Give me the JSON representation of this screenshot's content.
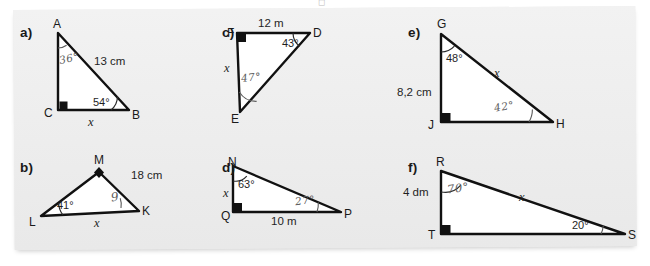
{
  "worksheet": {
    "top_partial_glyph": "◻",
    "problems": [
      {
        "id": "a",
        "label": "a)",
        "vertices": [
          {
            "name": "A"
          },
          {
            "name": "C"
          },
          {
            "name": "B"
          }
        ],
        "right_angle_at": "C",
        "angles": [
          {
            "at": "A",
            "value": "36°",
            "style": "handwritten"
          },
          {
            "at": "B",
            "value": "54°",
            "style": "printed"
          }
        ],
        "sides": [
          {
            "label": "13 cm",
            "kind": "measure"
          },
          {
            "label": "x",
            "kind": "unknown"
          }
        ]
      },
      {
        "id": "b",
        "label": "b)",
        "vertices": [
          {
            "name": "M"
          },
          {
            "name": "L"
          },
          {
            "name": "K"
          }
        ],
        "marker_at": "M",
        "angles": [
          {
            "at": "L",
            "value": "41°",
            "style": "printed"
          },
          {
            "at": "K",
            "value": "9",
            "style": "handwritten"
          }
        ],
        "sides": [
          {
            "label": "18 cm",
            "kind": "measure"
          },
          {
            "label": "x",
            "kind": "unknown"
          }
        ]
      },
      {
        "id": "c",
        "label": "c)",
        "vertices": [
          {
            "name": "F"
          },
          {
            "name": "D"
          },
          {
            "name": "E"
          }
        ],
        "right_angle_at": "F",
        "angles": [
          {
            "at": "D",
            "value": "43°",
            "style": "printed"
          },
          {
            "at": "E",
            "value": "47°",
            "style": "handwritten"
          }
        ],
        "sides": [
          {
            "label": "12 m",
            "kind": "measure"
          },
          {
            "label": "x",
            "kind": "unknown"
          }
        ]
      },
      {
        "id": "d",
        "label": "d)",
        "vertices": [
          {
            "name": "N"
          },
          {
            "name": "Q"
          },
          {
            "name": "P"
          }
        ],
        "right_angle_at": "Q",
        "angles": [
          {
            "at": "N",
            "value": "63°",
            "style": "printed"
          },
          {
            "at": "P",
            "value": "27°",
            "style": "handwritten"
          }
        ],
        "sides": [
          {
            "label": "10 m",
            "kind": "measure"
          },
          {
            "label": "x",
            "kind": "unknown"
          }
        ]
      },
      {
        "id": "e",
        "label": "e)",
        "vertices": [
          {
            "name": "G"
          },
          {
            "name": "J"
          },
          {
            "name": "H"
          }
        ],
        "right_angle_at": "J",
        "angles": [
          {
            "at": "G",
            "value": "48°",
            "style": "printed"
          },
          {
            "at": "H",
            "value": "42°",
            "style": "handwritten"
          }
        ],
        "sides": [
          {
            "label": "8,2 cm",
            "kind": "measure"
          },
          {
            "label": "x",
            "kind": "unknown"
          }
        ]
      },
      {
        "id": "f",
        "label": "f)",
        "vertices": [
          {
            "name": "R"
          },
          {
            "name": "T"
          },
          {
            "name": "S"
          }
        ],
        "right_angle_at": "T",
        "angles": [
          {
            "at": "R",
            "value": "70°",
            "style": "handwritten"
          },
          {
            "at": "S",
            "value": "20°",
            "style": "printed"
          }
        ],
        "sides": [
          {
            "label": "4 dm",
            "kind": "measure"
          },
          {
            "label": "x",
            "kind": "unknown"
          }
        ]
      }
    ]
  },
  "colors": {
    "panel_background": "#ededed",
    "page_background": "#ffffff",
    "stroke": "#111111",
    "arc": "#5a5a5a",
    "handwriting": "#5d5d5d",
    "text": "#1a1a1a"
  }
}
